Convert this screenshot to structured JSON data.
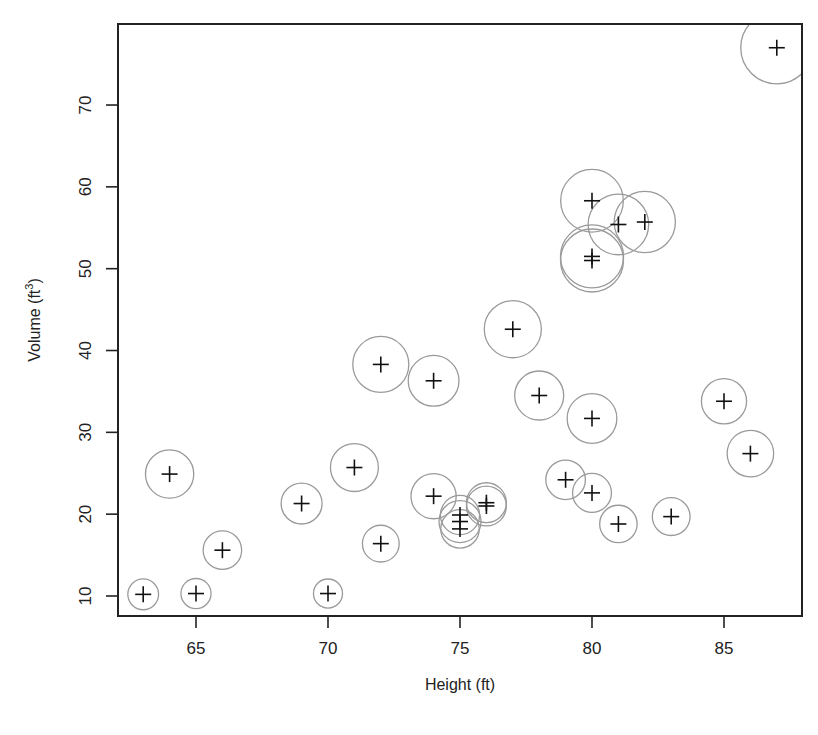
{
  "chart_data": {
    "type": "scatter",
    "title": "",
    "xlabel": "Height (ft)",
    "ylabel": "Volume (ft³)",
    "ylabel_base": "Volume (ft",
    "ylabel_sup": "3",
    "ylabel_close": ")",
    "xlim": [
      62.1,
      88.0
    ],
    "ylim": [
      7.6,
      79.9
    ],
    "xticks": [
      65,
      70,
      75,
      80,
      85
    ],
    "yticks": [
      10,
      20,
      30,
      40,
      50,
      60,
      70
    ],
    "grid": false,
    "legend": null,
    "marker": "plus",
    "bubble_size_variable": "Girth (in)",
    "colors": {
      "point": "#111111",
      "circle": "#9a9a9a",
      "axis": "#222222"
    },
    "points": [
      {
        "girth": 8.3,
        "height": 70,
        "volume": 10.3
      },
      {
        "girth": 8.6,
        "height": 65,
        "volume": 10.3
      },
      {
        "girth": 8.8,
        "height": 63,
        "volume": 10.2
      },
      {
        "girth": 10.5,
        "height": 72,
        "volume": 16.4
      },
      {
        "girth": 10.7,
        "height": 81,
        "volume": 18.8
      },
      {
        "girth": 10.8,
        "height": 83,
        "volume": 19.7
      },
      {
        "girth": 11.0,
        "height": 66,
        "volume": 15.6
      },
      {
        "girth": 11.0,
        "height": 75,
        "volume": 18.2
      },
      {
        "girth": 11.1,
        "height": 80,
        "volume": 22.6
      },
      {
        "girth": 11.2,
        "height": 75,
        "volume": 19.9
      },
      {
        "girth": 11.3,
        "height": 79,
        "volume": 24.2
      },
      {
        "girth": 11.4,
        "height": 76,
        "volume": 21.0
      },
      {
        "girth": 11.4,
        "height": 76,
        "volume": 21.4
      },
      {
        "girth": 11.7,
        "height": 69,
        "volume": 21.3
      },
      {
        "girth": 12.0,
        "height": 75,
        "volume": 19.1
      },
      {
        "girth": 12.9,
        "height": 74,
        "volume": 22.2
      },
      {
        "girth": 12.9,
        "height": 85,
        "volume": 33.8
      },
      {
        "girth": 13.3,
        "height": 86,
        "volume": 27.4
      },
      {
        "girth": 13.7,
        "height": 71,
        "volume": 25.7
      },
      {
        "girth": 13.8,
        "height": 64,
        "volume": 24.9
      },
      {
        "girth": 14.0,
        "height": 78,
        "volume": 34.5
      },
      {
        "girth": 14.2,
        "height": 80,
        "volume": 31.7
      },
      {
        "girth": 14.5,
        "height": 74,
        "volume": 36.3
      },
      {
        "girth": 16.0,
        "height": 72,
        "volume": 38.3
      },
      {
        "girth": 16.3,
        "height": 77,
        "volume": 42.6
      },
      {
        "girth": 17.3,
        "height": 81,
        "volume": 55.4
      },
      {
        "girth": 17.5,
        "height": 82,
        "volume": 55.7
      },
      {
        "girth": 17.9,
        "height": 80,
        "volume": 58.3
      },
      {
        "girth": 18.0,
        "height": 80,
        "volume": 51.5
      },
      {
        "girth": 18.0,
        "height": 80,
        "volume": 51.0
      },
      {
        "girth": 20.6,
        "height": 87,
        "volume": 77.0
      }
    ]
  },
  "layout": {
    "plot_left": 118,
    "plot_top": 24,
    "plot_right": 802,
    "plot_bottom": 616,
    "x_px_per_unit": 26.4,
    "x_ref_value": 65,
    "x_ref_px": 196,
    "y_px_per_unit": 8.183,
    "y_ref_value": 10,
    "y_ref_px": 596,
    "radius_scale": 1.75
  }
}
